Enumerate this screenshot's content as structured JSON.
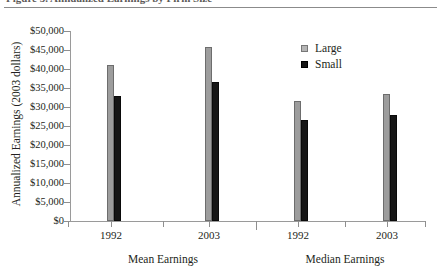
{
  "figure": {
    "caption_partial": "Figure 5. Annualized Earnings by Firm Size",
    "y_axis_title": "Annualized Earnings (2003 dollars)"
  },
  "legend": {
    "position": "top-right",
    "entries": [
      {
        "label": "Large",
        "color": "#9d9d9d",
        "icon": "square-swatch-large"
      },
      {
        "label": "Small",
        "color": "#161616",
        "icon": "square-swatch-small"
      }
    ]
  },
  "chart_data": {
    "type": "bar",
    "title": "",
    "xlabel": "",
    "ylabel": "Annualized Earnings (2003 dollars)",
    "ylim": [
      0,
      50000
    ],
    "ytick_values": [
      0,
      5000,
      10000,
      15000,
      20000,
      25000,
      30000,
      35000,
      40000,
      45000,
      50000
    ],
    "ytick_labels": [
      "$0",
      "$5,000",
      "$10,000",
      "$15,000",
      "$20,000",
      "$25,000",
      "$30,000",
      "$35,000",
      "$40,000",
      "$45,000",
      "$50,000"
    ],
    "grid": false,
    "categories": [
      "1992",
      "2003",
      "1992",
      "2003"
    ],
    "group_labels": [
      "Mean Earnings",
      "Median Earnings"
    ],
    "groups": [
      {
        "name": "Mean Earnings",
        "categories": [
          "1992",
          "2003"
        ]
      },
      {
        "name": "Median Earnings",
        "categories": [
          "1992",
          "2003"
        ]
      }
    ],
    "series": [
      {
        "name": "Large",
        "color": "#9d9d9d",
        "values": [
          41000,
          45800,
          31700,
          33500
        ]
      },
      {
        "name": "Small",
        "color": "#161616",
        "values": [
          32800,
          36600,
          26600,
          28000
        ]
      }
    ]
  }
}
